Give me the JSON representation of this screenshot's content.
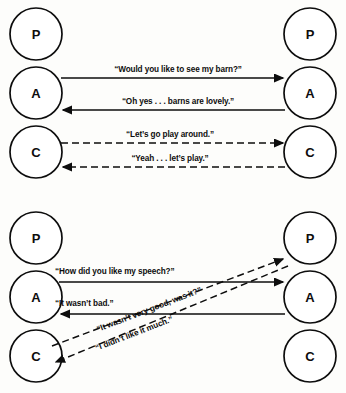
{
  "figure": {
    "kind": "transactional-analysis",
    "ego_state_labels": {
      "parent": "P",
      "adult": "A",
      "child": "C"
    },
    "colors": {
      "ink": "#0d0d0d",
      "paper": "#fdfdfb",
      "circle_fill": "#ffffff"
    }
  },
  "diagrams": [
    {
      "id": "complementary-transaction",
      "left_column": {
        "states": [
          {
            "id": "left-parent",
            "label": "P",
            "cx": 36,
            "cy": 34,
            "r": 26
          },
          {
            "id": "left-adult",
            "label": "A",
            "cx": 36,
            "cy": 93,
            "r": 26
          },
          {
            "id": "left-child",
            "label": "C",
            "cx": 36,
            "cy": 152,
            "r": 26
          }
        ]
      },
      "right_column": {
        "states": [
          {
            "id": "right-parent",
            "label": "P",
            "cx": 310,
            "cy": 34,
            "r": 26
          },
          {
            "id": "right-adult",
            "label": "A",
            "cx": 310,
            "cy": 93,
            "r": 26
          },
          {
            "id": "right-child",
            "label": "C",
            "cx": 310,
            "cy": 152,
            "r": 26
          }
        ]
      },
      "transactions": [
        {
          "id": "t1",
          "text": "“Would you like to see my barn?”",
          "style": "solid",
          "direction": "left-to-right",
          "x1": 61,
          "y1": 78,
          "x2": 285,
          "y2": 78,
          "label_x": 178,
          "label_y": 72
        },
        {
          "id": "t2",
          "text": "“Oh yes . . . barns are lovely.”",
          "style": "solid",
          "direction": "right-to-left",
          "x1": 285,
          "y1": 110,
          "x2": 61,
          "y2": 110,
          "label_x": 178,
          "label_y": 104
        },
        {
          "id": "t3",
          "text": "“Let’s go play around.”",
          "style": "dashed",
          "direction": "left-to-right",
          "x1": 61,
          "y1": 143,
          "x2": 285,
          "y2": 143,
          "label_x": 170,
          "label_y": 137
        },
        {
          "id": "t4",
          "text": "“Yeah . . . let’s play.”",
          "style": "dashed",
          "direction": "right-to-left",
          "x1": 285,
          "y1": 167,
          "x2": 61,
          "y2": 167,
          "label_x": 170,
          "label_y": 161
        }
      ]
    },
    {
      "id": "crossed-transaction",
      "left_column": {
        "states": [
          {
            "id": "left-parent",
            "label": "P",
            "cx": 36,
            "cy": 42,
            "r": 26
          },
          {
            "id": "left-adult",
            "label": "A",
            "cx": 36,
            "cy": 101,
            "r": 26
          },
          {
            "id": "left-child",
            "label": "C",
            "cx": 36,
            "cy": 160,
            "r": 26
          }
        ]
      },
      "right_column": {
        "states": [
          {
            "id": "right-parent",
            "label": "P",
            "cx": 310,
            "cy": 42,
            "r": 26
          },
          {
            "id": "right-adult",
            "label": "A",
            "cx": 310,
            "cy": 101,
            "r": 26
          },
          {
            "id": "right-child",
            "label": "C",
            "cx": 310,
            "cy": 160,
            "r": 26
          }
        ]
      },
      "transactions": [
        {
          "id": "b1",
          "text": "“How did you like my speech?”",
          "style": "solid",
          "direction": "left-to-right",
          "x1": 59,
          "y1": 86,
          "x2": 285,
          "y2": 86,
          "label_x": 55,
          "label_y": 78,
          "anchor": "start"
        },
        {
          "id": "b2",
          "text": "“It wasn’t bad.”",
          "style": "solid",
          "direction": "right-to-left",
          "x1": 285,
          "y1": 118,
          "x2": 59,
          "y2": 118,
          "label_x": 55,
          "label_y": 110,
          "anchor": "start"
        },
        {
          "id": "b3",
          "text": "“It wasn’t very good, was it?”",
          "style": "dashed",
          "direction": "lower-left-to-upper-right",
          "x1": 56,
          "y1": 145,
          "x2": 286,
          "y2": 88,
          "label_x": 148,
          "label_y": 116,
          "rotate": -14
        },
        {
          "id": "b4",
          "text": "“I didn’t like it much.”",
          "style": "dashed",
          "direction": "upper-right-to-lower-left",
          "x1": 288,
          "y1": 62,
          "x2": 56,
          "y2": 162,
          "label_x": 140,
          "label_y": 138,
          "rotate": -14
        }
      ]
    }
  ]
}
